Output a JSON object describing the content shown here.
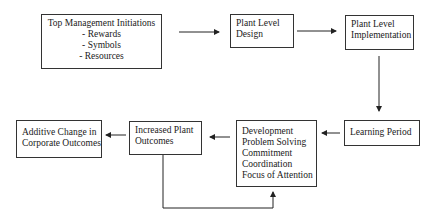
{
  "diagram": {
    "nodes": [
      {
        "id": "top_mgmt",
        "title": "Top Management Initiations",
        "items": [
          "- Rewards",
          "- Symbols",
          "- Resources"
        ]
      },
      {
        "id": "plant_design",
        "lines": [
          "Plant Level",
          "Design"
        ]
      },
      {
        "id": "plant_impl",
        "lines": [
          "Plant Level",
          "Implementation"
        ]
      },
      {
        "id": "learning",
        "lines": [
          "Learning Period"
        ]
      },
      {
        "id": "development",
        "lines": [
          "Development",
          "Problem Solving",
          "Commitment",
          "Coordination",
          "Focus of Attention"
        ]
      },
      {
        "id": "increased",
        "lines": [
          "Increased Plant",
          "Outcomes"
        ]
      },
      {
        "id": "additive",
        "lines": [
          "Additive Change in",
          "Corporate Outcomes"
        ]
      }
    ],
    "edges": [
      {
        "from": "top_mgmt",
        "to": "plant_design"
      },
      {
        "from": "plant_design",
        "to": "plant_impl"
      },
      {
        "from": "plant_impl",
        "to": "learning"
      },
      {
        "from": "learning",
        "to": "development"
      },
      {
        "from": "development",
        "to": "increased"
      },
      {
        "from": "increased",
        "to": "additive"
      },
      {
        "from": "increased",
        "to": "development",
        "type": "feedback-loop"
      }
    ]
  }
}
